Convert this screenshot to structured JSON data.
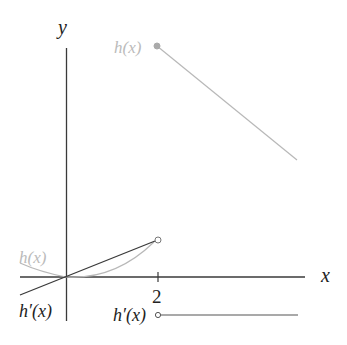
{
  "diagram": {
    "type": "function-graph",
    "axes": {
      "x_label": "x",
      "y_label": "y",
      "x_ticks": [
        {
          "value": 2,
          "label": "2"
        }
      ]
    },
    "functions": [
      {
        "name": "h(x)",
        "label": "h(x)",
        "color": "#b8b8b8",
        "pieces": [
          {
            "kind": "parabola",
            "domain": "x < 2",
            "through_origin": true,
            "end_point": {
              "x": 2,
              "y": 0.8,
              "marker": "open-circle"
            }
          },
          {
            "kind": "line",
            "domain": "x >= 2",
            "start_point": {
              "x": 2,
              "y": 5,
              "marker": "filled-circle"
            },
            "slope": "negative"
          }
        ]
      },
      {
        "name": "h'(x)",
        "label": "h'(x)",
        "color": "#3a3a3a",
        "pieces": [
          {
            "kind": "line",
            "domain": "x < 2",
            "through_origin": true,
            "end_point": {
              "x": 2,
              "y": 0.8,
              "marker": "open-circle"
            }
          },
          {
            "kind": "horizontal-line",
            "domain": "x > 2",
            "y": -0.8,
            "start_marker": "open-circle"
          }
        ]
      }
    ],
    "labels": {
      "h_upper": "h(x)",
      "h_left": "h(x)",
      "hprime_left": "h′(x)",
      "hprime_right": "h′(x)",
      "tick_2": "2",
      "x_axis": "x",
      "y_axis": "y"
    },
    "colors": {
      "axis": "#3a3a3a",
      "h": "#b8b8b8",
      "hprime": "#3a3a3a",
      "background": "#ffffff"
    }
  }
}
